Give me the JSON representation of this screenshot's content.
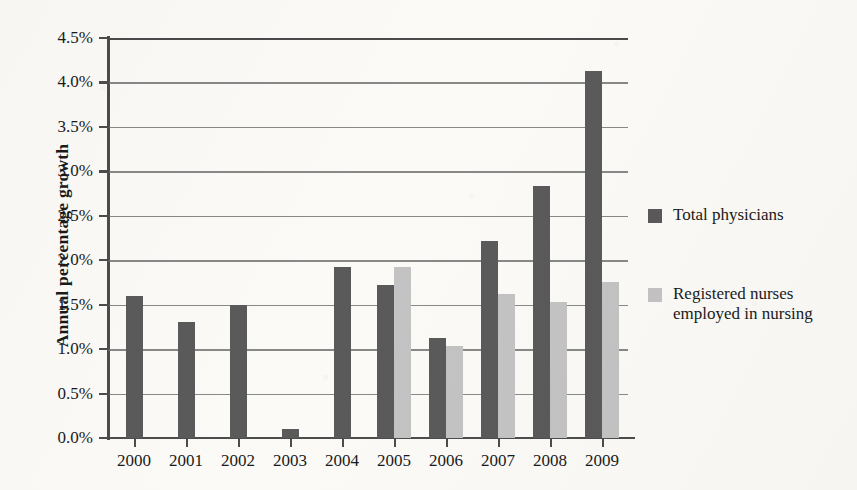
{
  "chart_data": {
    "type": "bar",
    "title": "",
    "xlabel": "",
    "ylabel": "Annual percentage growth",
    "categories": [
      "2000",
      "2001",
      "2002",
      "2003",
      "2004",
      "2005",
      "2006",
      "2007",
      "2008",
      "2009"
    ],
    "series": [
      {
        "name": "Total physicians",
        "color": "#5a5a5a",
        "values": [
          1.6,
          1.31,
          1.5,
          0.1,
          1.92,
          1.72,
          1.13,
          2.22,
          2.84,
          4.13
        ]
      },
      {
        "name": "Registered nurses employed in nursing",
        "color": "#c3c3c3",
        "values": [
          null,
          null,
          null,
          null,
          null,
          1.92,
          1.04,
          1.62,
          1.53,
          1.76
        ]
      }
    ],
    "ylim": [
      0,
      4.5
    ],
    "ytick_step": 0.5,
    "ytick_labels": [
      "0.0%",
      "0.5%",
      "1.0%",
      "1.5%",
      "2.0%",
      "2.5%",
      "3.0%",
      "3.5%",
      "4.0%",
      "4.5%"
    ],
    "ytick_values": [
      0,
      0.5,
      1.0,
      1.5,
      2.0,
      2.5,
      3.0,
      3.5,
      4.0,
      4.5
    ],
    "grid": true,
    "grid_axis": "y",
    "legend_position": "right",
    "legend": [
      {
        "label": "Total physicians",
        "color": "#5a5a5a"
      },
      {
        "label": "Registered nurses employed in nursing",
        "color": "#c3c3c3"
      }
    ]
  },
  "legend_display": [
    {
      "line1": "Total physicians",
      "line2": ""
    },
    {
      "line1": "Registered nurses",
      "line2": "employed in nursing"
    }
  ]
}
